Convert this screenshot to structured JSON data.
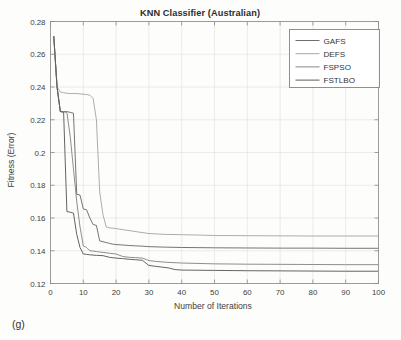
{
  "figure": {
    "panel_label": "(g)",
    "background_color": "#fdfdfb"
  },
  "chart_data": {
    "type": "line",
    "title": "KNN Classifier (Australian)",
    "subtitle": "",
    "xlabel": "Number of Iterations",
    "ylabel": "Fitness (Error)",
    "xlim": [
      0,
      100
    ],
    "ylim": [
      0.12,
      0.28
    ],
    "xticks": [
      0,
      10,
      20,
      30,
      40,
      50,
      60,
      70,
      80,
      90,
      100
    ],
    "xtick_labels": [
      "0",
      "10",
      "20",
      "30",
      "40",
      "50",
      "60",
      "70",
      "80",
      "90",
      "100"
    ],
    "yticks": [
      0.12,
      0.14,
      0.16,
      0.18,
      0.2,
      0.22,
      0.24,
      0.26,
      0.28
    ],
    "ytick_labels": [
      "0.12",
      "0.14",
      "0.16",
      "0.18",
      "0.2",
      "0.22",
      "0.24",
      "0.26",
      "0.28"
    ],
    "grid": true,
    "legend_position": "upper right",
    "legend_labels": [
      "GAFS",
      "DEFS",
      "FSPSO",
      "FSTLBO"
    ],
    "series": [
      {
        "name": "GAFS",
        "color": "#6e6e6e",
        "final_value": 0.1415,
        "x": [
          1,
          2,
          3,
          4,
          5,
          6,
          7,
          8,
          9,
          10,
          11,
          12,
          13,
          14,
          15,
          16,
          17,
          18,
          19,
          20,
          22,
          24,
          26,
          28,
          30,
          35,
          40,
          50,
          60,
          70,
          80,
          90,
          100
        ],
        "values": [
          0.271,
          0.24,
          0.225,
          0.225,
          0.225,
          0.2245,
          0.224,
          0.1745,
          0.174,
          0.1655,
          0.165,
          0.16,
          0.156,
          0.1555,
          0.146,
          0.1455,
          0.145,
          0.1445,
          0.144,
          0.1438,
          0.1435,
          0.1432,
          0.143,
          0.1428,
          0.1425,
          0.1422,
          0.142,
          0.1418,
          0.1417,
          0.1416,
          0.1416,
          0.1415,
          0.1415
        ]
      },
      {
        "name": "DEFS",
        "color": "#a8a8a8",
        "final_value": 0.149,
        "x": [
          1,
          2,
          3,
          4,
          5,
          6,
          7,
          8,
          9,
          10,
          11,
          12,
          13,
          14,
          15,
          16,
          17,
          18,
          19,
          20,
          25,
          30,
          35,
          40,
          45,
          50,
          60,
          70,
          80,
          90,
          100
        ],
        "values": [
          0.271,
          0.24,
          0.237,
          0.2365,
          0.2362,
          0.236,
          0.236,
          0.236,
          0.2358,
          0.2356,
          0.2354,
          0.235,
          0.233,
          0.22,
          0.176,
          0.162,
          0.1545,
          0.154,
          0.1538,
          0.1535,
          0.152,
          0.1505,
          0.15,
          0.1498,
          0.1496,
          0.1493,
          0.1492,
          0.1491,
          0.149,
          0.149,
          0.149
        ]
      },
      {
        "name": "FSPSO",
        "color": "#878787",
        "final_value": 0.1315,
        "x": [
          1,
          2,
          3,
          4,
          5,
          6,
          7,
          8,
          9,
          10,
          11,
          12,
          13,
          14,
          15,
          16,
          18,
          20,
          22,
          24,
          26,
          28,
          30,
          32,
          35,
          40,
          50,
          60,
          70,
          80,
          90,
          100
        ],
        "values": [
          0.271,
          0.24,
          0.225,
          0.2248,
          0.2245,
          0.21,
          0.19,
          0.17,
          0.1545,
          0.143,
          0.142,
          0.14,
          0.1398,
          0.1395,
          0.1392,
          0.139,
          0.1385,
          0.138,
          0.1365,
          0.136,
          0.1358,
          0.1355,
          0.134,
          0.1335,
          0.133,
          0.1325,
          0.132,
          0.1318,
          0.1317,
          0.1316,
          0.1315,
          0.1315
        ]
      },
      {
        "name": "FSTLBO",
        "color": "#5c5c5c",
        "final_value": 0.1275,
        "x": [
          1,
          2,
          3,
          4,
          5,
          6,
          7,
          8,
          9,
          10,
          11,
          12,
          14,
          16,
          18,
          20,
          22,
          24,
          26,
          28,
          30,
          32,
          34,
          36,
          38,
          40,
          50,
          60,
          70,
          80,
          90,
          100
        ],
        "values": [
          0.271,
          0.24,
          0.225,
          0.2245,
          0.164,
          0.1635,
          0.163,
          0.15,
          0.142,
          0.138,
          0.1378,
          0.1375,
          0.1372,
          0.137,
          0.136,
          0.1355,
          0.1352,
          0.1348,
          0.1345,
          0.1342,
          0.131,
          0.1305,
          0.13,
          0.1295,
          0.1285,
          0.1282,
          0.128,
          0.1278,
          0.1277,
          0.1276,
          0.1275,
          0.1275
        ]
      }
    ]
  }
}
